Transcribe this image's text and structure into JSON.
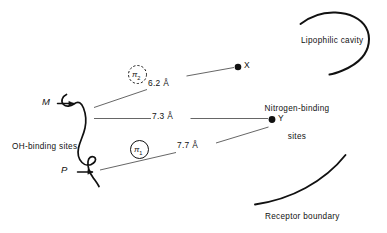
{
  "figure": {
    "background_color": "#ffffff",
    "ink_color": "#111111"
  },
  "binding_points": {
    "m_label": "M",
    "p_label": "P",
    "x_label": "X",
    "y_label": "Y"
  },
  "pi_sites": {
    "pi2_symbol": "π",
    "pi2_sub": "2",
    "pi2_style": "dashed-circle",
    "pi1_symbol": "π",
    "pi1_sub": "1",
    "pi1_style": "solid-circle"
  },
  "distances": {
    "m_to_x": "6.2 Å",
    "m_to_y": "7.3 Å",
    "p_to_y": "7.7 Å"
  },
  "annotations": {
    "oh_binding": "OH-binding sites",
    "nitrogen_binding_line1": "Nitrogen-binding",
    "nitrogen_binding_line2": "sites",
    "lipophilic_cavity": "Lipophilic cavity",
    "receptor_boundary": "Receptor boundary"
  }
}
